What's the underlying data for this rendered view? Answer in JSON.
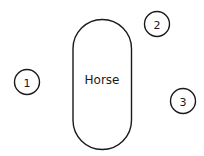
{
  "diagram": {
    "horse": {
      "label": "Horse"
    },
    "positions": [
      {
        "number": "1"
      },
      {
        "number": "2"
      },
      {
        "number": "3"
      }
    ]
  },
  "colors": {
    "stroke": "#1a1a1a",
    "background": "#ffffff"
  }
}
